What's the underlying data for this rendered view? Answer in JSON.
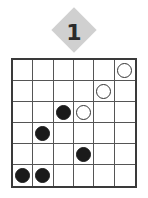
{
  "puzzle": {
    "number": "1",
    "badge_color": "#d0d0d0",
    "rows": 6,
    "cols": 6,
    "stones": [
      {
        "row": 0,
        "col": 5,
        "color": "white"
      },
      {
        "row": 1,
        "col": 4,
        "color": "white"
      },
      {
        "row": 2,
        "col": 2,
        "color": "black"
      },
      {
        "row": 2,
        "col": 3,
        "color": "white"
      },
      {
        "row": 3,
        "col": 1,
        "color": "black"
      },
      {
        "row": 4,
        "col": 3,
        "color": "black"
      },
      {
        "row": 5,
        "col": 0,
        "color": "black"
      },
      {
        "row": 5,
        "col": 1,
        "color": "black"
      }
    ]
  }
}
